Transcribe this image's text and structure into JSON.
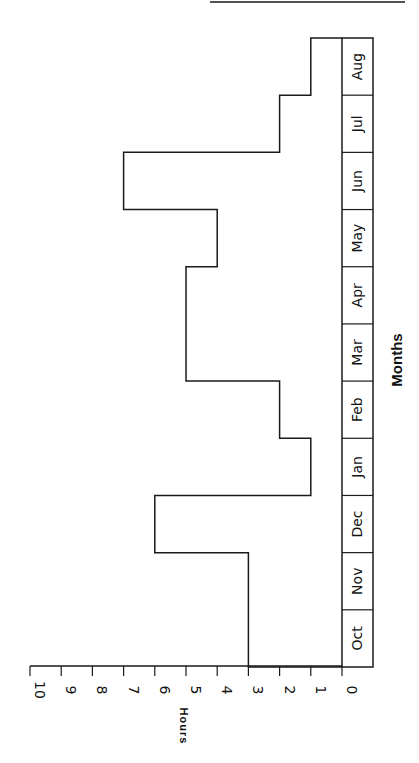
{
  "chart_data": {
    "type": "bar",
    "subtype": "histogram-step",
    "orientation": "rotated-90-clockwise",
    "title": "",
    "xlabel": "Months",
    "ylabel": "Hours",
    "categories": [
      "Oct",
      "Nov",
      "Dec",
      "Jan",
      "Feb",
      "Mar",
      "Apr",
      "May",
      "Jun",
      "Jul",
      "Aug"
    ],
    "values": [
      3,
      3,
      6,
      1,
      2,
      5,
      5,
      4,
      7,
      2,
      1
    ],
    "ylim": [
      0,
      10
    ],
    "yticks": [
      "0",
      "1",
      "2",
      "3",
      "4",
      "5",
      "6",
      "7",
      "8",
      "9",
      "10"
    ],
    "grid": false,
    "legend": null
  },
  "colors": {
    "line": "#1a1a1a",
    "background": "#ffffff"
  }
}
